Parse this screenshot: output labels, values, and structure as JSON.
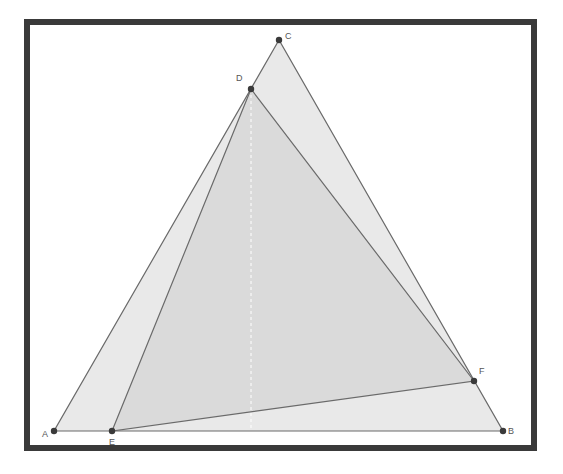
{
  "diagram": {
    "frame": {
      "x": 27,
      "y": 22,
      "width": 507,
      "height": 426,
      "stroke": "#3a3a3a",
      "stroke_width": 6
    },
    "colors": {
      "outer_fill": "#e9e9e9",
      "inner_fill": "#dadada",
      "edge": "#6a6a6a",
      "point": "#3a3a3a",
      "dashed": "#ffffff"
    },
    "points": [
      {
        "name": "A",
        "x": 54,
        "y": 431,
        "label_dx": -12,
        "label_dy": 6
      },
      {
        "name": "B",
        "x": 503,
        "y": 431,
        "label_dx": 5,
        "label_dy": 3
      },
      {
        "name": "C",
        "x": 279,
        "y": 40,
        "label_dx": 6,
        "label_dy": -1
      },
      {
        "name": "D",
        "x": 251,
        "y": 89,
        "label_dx": -15,
        "label_dy": -8
      },
      {
        "name": "E",
        "x": 112,
        "y": 431,
        "label_dx": -3,
        "label_dy": 14
      },
      {
        "name": "F",
        "x": 474,
        "y": 381,
        "label_dx": 5,
        "label_dy": -7
      }
    ],
    "triangles": [
      {
        "name": "ABC",
        "vertices": [
          "A",
          "B",
          "C"
        ]
      },
      {
        "name": "DEF",
        "vertices": [
          "D",
          "E",
          "F"
        ]
      }
    ],
    "dashed_segment": {
      "from": "D",
      "to_x": 251,
      "to_y": 431
    },
    "labels": {
      "A": "A",
      "B": "B",
      "C": "C",
      "D": "D",
      "E": "E",
      "F": "F"
    }
  }
}
